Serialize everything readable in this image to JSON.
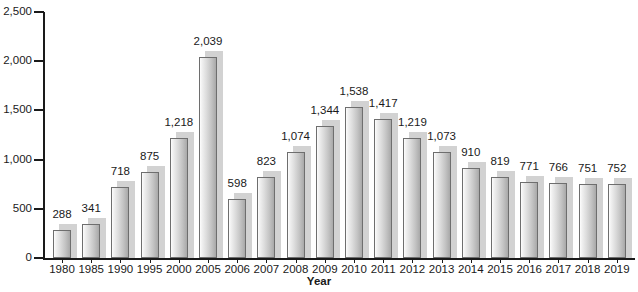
{
  "chart_data": {
    "type": "bar",
    "title": "",
    "xlabel": "Year",
    "ylabel": "",
    "ylim": [
      0,
      2500
    ],
    "ytick_values": [
      0,
      500,
      1000,
      1500,
      2000,
      2500
    ],
    "ytick_labels": [
      "0",
      "500",
      "1,000",
      "1,500",
      "2,000",
      "2,500"
    ],
    "grid": false,
    "legend": null,
    "categories": [
      "1980",
      "1985",
      "1990",
      "1995",
      "2000",
      "2005",
      "2006",
      "2007",
      "2008",
      "2009",
      "2010",
      "2011",
      "2012",
      "2013",
      "2014",
      "2015",
      "2016",
      "2017",
      "2018",
      "2019"
    ],
    "values": [
      288,
      341,
      718,
      875,
      1218,
      2039,
      598,
      823,
      1074,
      1344,
      1538,
      1417,
      1219,
      1073,
      910,
      819,
      771,
      766,
      751,
      752
    ],
    "value_labels": [
      "288",
      "341",
      "718",
      "875",
      "1,218",
      "2,039",
      "598",
      "823",
      "1,074",
      "1,344",
      "1,538",
      "1,417",
      "1,219",
      "1,073",
      "910",
      "819",
      "771",
      "766",
      "751",
      "752"
    ]
  },
  "style": {
    "bar_fill_light": "#fdfdfd",
    "bar_fill_dark": "#a8a8a8",
    "bar_border": "#6e6e6e",
    "shadow_color": "#d2d2d2",
    "axis_color": "#1a1a1a",
    "text_color": "#1a1a1a",
    "background": "#ffffff"
  }
}
